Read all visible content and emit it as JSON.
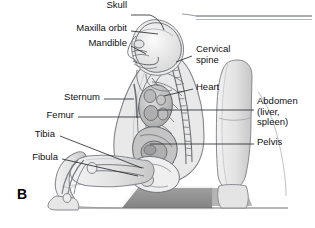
{
  "figure": {
    "panel_letter": "B",
    "description_alt": "Lateral view of a seated infant in a car seat showing skeletal and organ anatomy"
  },
  "labels": {
    "left": [
      {
        "id": "skull",
        "text": "Skull",
        "x": 127,
        "y": 10,
        "align": "right"
      },
      {
        "id": "maxilla-orbit",
        "text": "Maxilla orbit",
        "x": 127,
        "y": 28,
        "align": "right"
      },
      {
        "id": "mandible",
        "text": "Mandible",
        "x": 127,
        "y": 43,
        "align": "right"
      },
      {
        "id": "sternum",
        "text": "Sternum",
        "x": 100,
        "y": 96,
        "align": "right"
      },
      {
        "id": "femur",
        "text": "Femur",
        "x": 74,
        "y": 114,
        "align": "right"
      },
      {
        "id": "tibia",
        "text": "Tibia",
        "x": 55,
        "y": 133,
        "align": "right"
      },
      {
        "id": "fibula",
        "text": "Fibula",
        "x": 58,
        "y": 156,
        "align": "right"
      }
    ],
    "right": [
      {
        "id": "cervical-spine",
        "text": "Cervical\nspine",
        "x": 196,
        "y": 48
      },
      {
        "id": "heart",
        "text": "Heart",
        "x": 196,
        "y": 86
      },
      {
        "id": "abdomen",
        "text": "Abdomen\n(liver,\nspleen)",
        "x": 257,
        "y": 100
      },
      {
        "id": "pelvis",
        "text": "Pelvis",
        "x": 257,
        "y": 141
      }
    ]
  },
  "colors": {
    "outline": "#55585c",
    "line_leader": "#2a2d31",
    "skin_light": "#ededed",
    "skin_mid": "#dedede",
    "skin_shadow": "#c9c9c9",
    "bone": "#f2f2f2",
    "organ_fill": "#cfcfcf",
    "organ_dark": "#9a9a9a",
    "seat_dark": "#8c8c8c",
    "seat_mid": "#bdbdbd",
    "background": "#ffffff",
    "text": "#101010"
  }
}
